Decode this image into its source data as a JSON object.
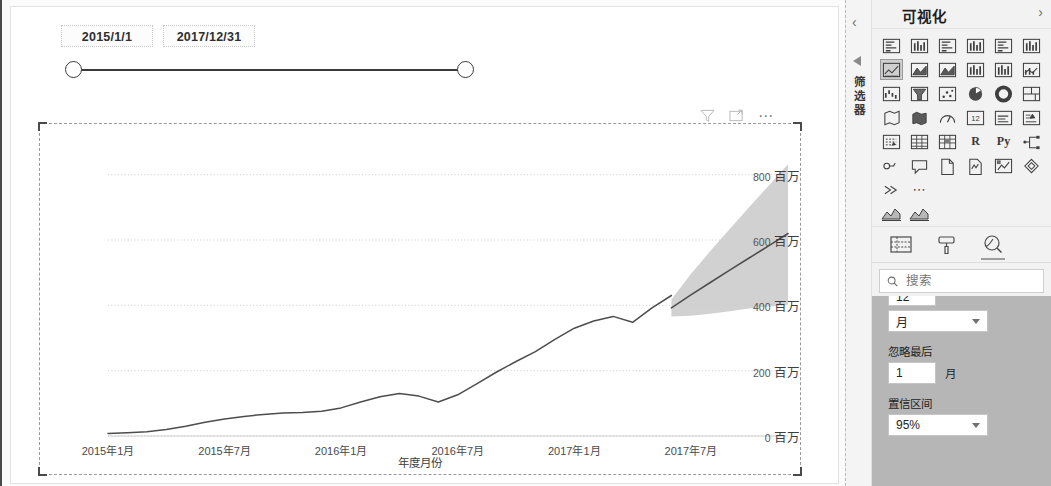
{
  "slicer": {
    "start_date": "2015/1/1",
    "end_date": "2017/12/31"
  },
  "visual_tools": {
    "filter_label": "filter-icon",
    "focus_label": "focus-mode-icon",
    "more_label": "⋯"
  },
  "chart_data": {
    "type": "line",
    "title": "",
    "xlabel": "年度月份",
    "ylabel": "",
    "ylim": [
      0,
      900
    ],
    "ytick_values": [
      0,
      200,
      400,
      600,
      800
    ],
    "ytick_labels": [
      "0",
      "200",
      "400",
      "600",
      "800"
    ],
    "yunit": "百万",
    "grid": true,
    "legend": "none",
    "xtick_labels": [
      "2015年1月",
      "2015年7月",
      "2016年1月",
      "2016年7月",
      "2017年1月",
      "2017年7月"
    ],
    "xtick_index": [
      0,
      6,
      12,
      18,
      24,
      30
    ],
    "x": [
      "2015-01",
      "2015-02",
      "2015-03",
      "2015-04",
      "2015-05",
      "2015-06",
      "2015-07",
      "2015-08",
      "2015-09",
      "2015-10",
      "2015-11",
      "2015-12",
      "2016-01",
      "2016-02",
      "2016-03",
      "2016-04",
      "2016-05",
      "2016-06",
      "2016-07",
      "2016-08",
      "2016-09",
      "2016-10",
      "2016-11",
      "2016-12",
      "2017-01",
      "2017-02",
      "2017-03",
      "2017-04",
      "2017-05",
      "2017-06",
      "2017-07",
      "2017-08",
      "2017-09",
      "2017-10",
      "2017-11",
      "2017-12"
    ],
    "series": [
      {
        "name": "actual",
        "kind": "line",
        "values": [
          8,
          10,
          13,
          20,
          30,
          42,
          52,
          60,
          66,
          70,
          72,
          76,
          86,
          104,
          120,
          130,
          122,
          104,
          126,
          160,
          196,
          228,
          258,
          296,
          330,
          352,
          366,
          348,
          392,
          430,
          null,
          null,
          null,
          null,
          null,
          null
        ]
      },
      {
        "name": "forecast",
        "kind": "line-dashed",
        "values": [
          null,
          null,
          null,
          null,
          null,
          null,
          null,
          null,
          null,
          null,
          null,
          null,
          null,
          null,
          null,
          null,
          null,
          null,
          null,
          null,
          null,
          null,
          null,
          null,
          null,
          null,
          null,
          null,
          null,
          392,
          432,
          470,
          508,
          545,
          582,
          620
        ]
      },
      {
        "name": "confidence_upper",
        "kind": "band",
        "values": [
          null,
          null,
          null,
          null,
          null,
          null,
          null,
          null,
          null,
          null,
          null,
          null,
          null,
          null,
          null,
          null,
          null,
          null,
          null,
          null,
          null,
          null,
          null,
          null,
          null,
          null,
          null,
          null,
          null,
          418,
          496,
          566,
          634,
          700,
          766,
          832
        ]
      },
      {
        "name": "confidence_lower",
        "kind": "band",
        "values": [
          null,
          null,
          null,
          null,
          null,
          null,
          null,
          null,
          null,
          null,
          null,
          null,
          null,
          null,
          null,
          null,
          null,
          null,
          null,
          null,
          null,
          null,
          null,
          null,
          null,
          null,
          null,
          null,
          null,
          366,
          368,
          374,
          382,
          390,
          396,
          402
        ]
      }
    ],
    "forecast_start_index": 29,
    "band_color": "#c9c9c9",
    "line_color": "#4d4d4d"
  },
  "right_pane": {
    "filters_rail": {
      "collapse_label": "‹",
      "label": "筛选器"
    },
    "visualizations": {
      "title": "可视化",
      "prev_label": "‹",
      "next_label": "›",
      "icons": [
        {
          "name": "stacked-bar-chart-icon",
          "selected": false
        },
        {
          "name": "stacked-column-chart-icon",
          "selected": false
        },
        {
          "name": "clustered-bar-chart-icon",
          "selected": false
        },
        {
          "name": "clustered-column-chart-icon",
          "selected": false
        },
        {
          "name": "hundred-percent-stacked-bar-chart-icon",
          "selected": false
        },
        {
          "name": "hundred-percent-stacked-column-chart-icon",
          "selected": false
        },
        {
          "name": "line-chart-icon",
          "selected": true
        },
        {
          "name": "area-chart-icon",
          "selected": false
        },
        {
          "name": "stacked-area-chart-icon",
          "selected": false
        },
        {
          "name": "line-and-stacked-column-chart-icon",
          "selected": false
        },
        {
          "name": "line-and-clustered-column-chart-icon",
          "selected": false
        },
        {
          "name": "ribbon-chart-icon",
          "selected": false
        },
        {
          "name": "waterfall-chart-icon",
          "selected": false
        },
        {
          "name": "funnel-chart-icon",
          "selected": false
        },
        {
          "name": "scatter-chart-icon",
          "selected": false
        },
        {
          "name": "pie-chart-icon",
          "selected": false
        },
        {
          "name": "donut-chart-icon",
          "selected": false
        },
        {
          "name": "treemap-icon",
          "selected": false
        },
        {
          "name": "map-icon",
          "selected": false
        },
        {
          "name": "filled-map-icon",
          "selected": false
        },
        {
          "name": "gauge-icon",
          "selected": false
        },
        {
          "name": "kpi-icon",
          "selected": false
        },
        {
          "name": "card-icon",
          "selected": false
        },
        {
          "name": "multi-row-card-icon",
          "selected": false
        },
        {
          "name": "slicer-icon",
          "selected": false
        },
        {
          "name": "table-icon",
          "selected": false
        },
        {
          "name": "matrix-icon",
          "selected": false
        },
        {
          "name": "r-script-visual-icon",
          "label": "R",
          "selected": false
        },
        {
          "name": "python-visual-icon",
          "label": "Py",
          "selected": false
        },
        {
          "name": "decomposition-tree-icon",
          "selected": false
        },
        {
          "name": "key-influencers-icon",
          "selected": false
        },
        {
          "name": "q-and-a-icon",
          "selected": false
        },
        {
          "name": "paginated-report-icon",
          "selected": false
        },
        {
          "name": "smart-narrative-icon",
          "selected": false
        },
        {
          "name": "power-apps-icon",
          "selected": false
        },
        {
          "name": "power-automate-icon",
          "selected": false
        },
        {
          "name": "get-more-visuals-icon",
          "selected": false
        },
        {
          "name": "more-options-icon",
          "label": "⋯",
          "selected": false
        }
      ],
      "mini_icons": [
        {
          "name": "azure-map-mini-icon"
        },
        {
          "name": "line-chart-mini-icon"
        }
      ]
    },
    "pane_tabs": [
      {
        "name": "tab-fields",
        "icon": "fields-table-icon",
        "selected": false
      },
      {
        "name": "tab-format",
        "icon": "paint-roller-icon",
        "selected": false
      },
      {
        "name": "tab-analytics",
        "icon": "analytics-magnifier-icon",
        "selected": true
      }
    ],
    "search": {
      "placeholder": "搜索",
      "value": "",
      "icon": "search-icon"
    },
    "forecast_settings": {
      "length_value": "12",
      "unit_value": "月",
      "ignore_last_label": "忽略最后",
      "ignore_last_value": "1",
      "ignore_last_suffix": "月",
      "confidence_label": "置信区间",
      "confidence_value": "95%"
    }
  }
}
